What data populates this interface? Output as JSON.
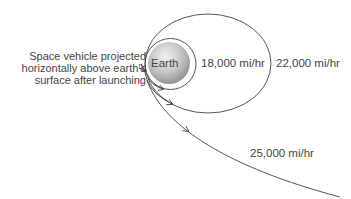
{
  "diagram": {
    "description_lines": [
      "Space vehicle projected",
      "horizontally above earth's",
      "surface after launching"
    ],
    "earth_label": "Earth",
    "trajectories": [
      {
        "shape": "circle",
        "speed_label": "18,000 mi/hr"
      },
      {
        "shape": "ellipse",
        "speed_label": "22,000 mi/hr"
      },
      {
        "shape": "escape-curve",
        "speed_label": "25,000 mi/hr"
      }
    ],
    "colors": {
      "line": "#555555",
      "text": "#444444",
      "earth_light": "#eeeeee",
      "earth_dark": "#8a8a8a"
    }
  }
}
